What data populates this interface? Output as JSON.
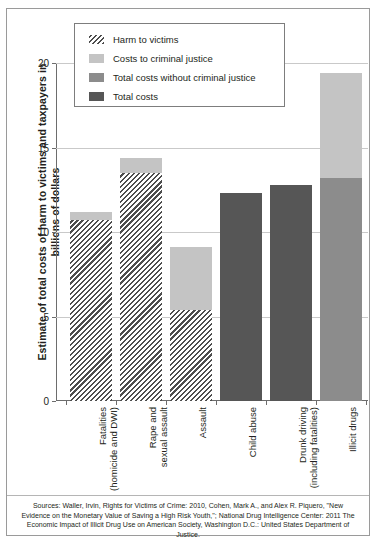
{
  "chart_data": {
    "type": "bar",
    "title": "",
    "subtitle": "",
    "xlabel": "",
    "ylabel": "Estimate of total costs of harm to victims and taxpayers in billions of dollars",
    "ylim": [
      0,
      20
    ],
    "yticks": [
      0,
      5,
      10,
      15,
      20
    ],
    "ytick_labels": [
      "0",
      "5",
      "10",
      "15",
      "20"
    ],
    "grid": "horizontal",
    "legend_position": "top-center",
    "stacked": true,
    "units": "billions of dollars",
    "categories": [
      "Fatalities\n(homicide and DWI)",
      "Rape and\nsexual assault",
      "Assault",
      "Child abuse",
      "Drunk driving\n(including fatalities)",
      "Illicit drugs"
    ],
    "series": [
      {
        "name": "Harm to victims",
        "key": "harm",
        "color": "#4d4d4d",
        "pattern": "diagonal-hatch",
        "values": [
          10.7,
          13.5,
          5.4,
          null,
          null,
          null
        ]
      },
      {
        "name": "Costs to criminal justice",
        "key": "criminal_justice",
        "color": "#c4c4c4",
        "pattern": "solid",
        "values": [
          0.5,
          0.9,
          3.7,
          null,
          null,
          6.2
        ]
      },
      {
        "name": "Total costs without criminal justice",
        "key": "total_without_cj",
        "color": "#8c8c8c",
        "pattern": "solid",
        "values": [
          null,
          null,
          null,
          null,
          null,
          13.2
        ]
      },
      {
        "name": "Total costs",
        "key": "total",
        "color": "#565656",
        "pattern": "solid",
        "values": [
          null,
          null,
          null,
          12.3,
          12.8,
          null
        ]
      }
    ],
    "bar_totals": [
      11.2,
      14.4,
      9.1,
      12.3,
      12.8,
      19.4
    ],
    "bars": [
      {
        "category": "Fatalities (homicide and DWI)",
        "segments": [
          {
            "series": "Harm to victims",
            "from": 0,
            "to": 10.7
          },
          {
            "series": "Costs to criminal justice",
            "from": 10.7,
            "to": 11.2
          }
        ]
      },
      {
        "category": "Rape and sexual assault",
        "segments": [
          {
            "series": "Harm to victims",
            "from": 0,
            "to": 13.5
          },
          {
            "series": "Costs to criminal justice",
            "from": 13.5,
            "to": 14.4
          }
        ]
      },
      {
        "category": "Assault",
        "segments": [
          {
            "series": "Harm to victims",
            "from": 0,
            "to": 5.4
          },
          {
            "series": "Costs to criminal justice",
            "from": 5.4,
            "to": 9.1
          }
        ]
      },
      {
        "category": "Child abuse",
        "segments": [
          {
            "series": "Total costs",
            "from": 0,
            "to": 12.3
          }
        ]
      },
      {
        "category": "Drunk driving (including fatalities)",
        "segments": [
          {
            "series": "Total costs",
            "from": 0,
            "to": 12.8
          }
        ]
      },
      {
        "category": "Illicit drugs",
        "segments": [
          {
            "series": "Total costs without criminal justice",
            "from": 0,
            "to": 13.2
          },
          {
            "series": "Costs to criminal justice",
            "from": 13.2,
            "to": 19.4
          }
        ]
      }
    ]
  },
  "legend": {
    "items": [
      {
        "label": "Harm to victims",
        "swatch": "hatch"
      },
      {
        "label": "Costs to criminal justice",
        "swatch": "cj"
      },
      {
        "label": "Total costs without criminal justice",
        "swatch": "nocj"
      },
      {
        "label": "Total costs",
        "swatch": "total"
      }
    ]
  },
  "source_note": "Sources: Waller, Irvin, Rights for Victims of Crime: 2010, Cohen, Mark A., and Alex R. Piquero, \"New Evidence on the Monetary Value of Saving a High Risk Youth,\"; National Drug Intelligence Center: 2011 The Economic Impact of Illicit Drug Use on American Society, Washington D.C.: United States Department of Justice.",
  "colors": {
    "hatch": "#4d4d4d",
    "criminal_justice": "#c4c4c4",
    "total_without_cj": "#8c8c8c",
    "total": "#565656",
    "grid": "#c9c9c9",
    "axis": "#6d6d6d",
    "frame": "#9a9a9a",
    "text": "#231f20"
  }
}
